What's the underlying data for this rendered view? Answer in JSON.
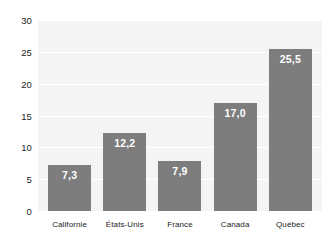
{
  "chart_data": {
    "type": "bar",
    "title": "",
    "subtitle": "",
    "xlabel": "",
    "ylabel": "",
    "categories": [
      "Californie",
      "États-Unis",
      "France",
      "Canada",
      "Québec"
    ],
    "values": [
      7.3,
      12.2,
      7.9,
      17.0,
      25.5
    ],
    "value_labels": [
      "7,3",
      "12,2",
      "7,9",
      "17,0",
      "25,5"
    ],
    "ylim": [
      0,
      30
    ],
    "ytick_values": [
      0,
      5,
      10,
      15,
      20,
      25,
      30
    ],
    "ytick_labels": [
      "0",
      "5",
      "10",
      "15",
      "20",
      "25",
      "30"
    ],
    "grid": true,
    "legend": "none",
    "decimal_separator": ",",
    "bar_color": "#7d7d7d",
    "plot_background": "#f4f4f4",
    "gridline_color": "#ffffff",
    "value_label_color": "#ffffff",
    "axis_text_color": "#1b1b1b"
  }
}
